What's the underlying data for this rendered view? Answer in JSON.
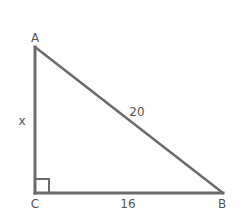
{
  "diagram": {
    "type": "right-triangle",
    "colors": {
      "line": "#6b6b6b",
      "label": "#555555",
      "background": "#ffffff"
    },
    "vertices": {
      "A": {
        "label": "A",
        "x": 35,
        "y": 47
      },
      "B": {
        "label": "B",
        "x": 223,
        "y": 193
      },
      "C": {
        "label": "C",
        "x": 35,
        "y": 193
      }
    },
    "sides": {
      "AC": {
        "label": "x"
      },
      "AB": {
        "label": "20"
      },
      "CB": {
        "label": "16"
      }
    },
    "right_angle_at": "C"
  }
}
